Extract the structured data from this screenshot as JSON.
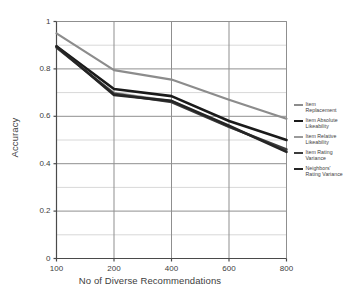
{
  "chart_data": {
    "type": "line",
    "title": "",
    "xlabel": "No of Diverse Recommendations",
    "ylabel": "Accuracy",
    "x": [
      100,
      200,
      400,
      600,
      800
    ],
    "xtick_labels": [
      "100",
      "200",
      "400",
      "600",
      "800"
    ],
    "ytick_labels": [
      "0",
      "0.2",
      "0.4",
      "0.6",
      "0.8",
      "1"
    ],
    "ytick_values": [
      0,
      0.2,
      0.4,
      0.6,
      0.8,
      1
    ],
    "ylim": [
      0,
      1
    ],
    "xscale": "categorical",
    "grid": true,
    "minor_grid": true,
    "legend_position": "right",
    "series": [
      {
        "name": "Item Replacement",
        "color": "#8c8c8c",
        "width": 2.2,
        "values": [
          0.95,
          0.795,
          0.755,
          0.67,
          0.59
        ]
      },
      {
        "name": "Item Absolute Likeability",
        "color": "#1a1a1a",
        "width": 2.6,
        "values": [
          0.895,
          0.715,
          0.685,
          0.58,
          0.5
        ]
      },
      {
        "name": "Item Relative Likeability",
        "color": "#9a9a9a",
        "width": 1.8,
        "values": [
          0.89,
          0.7,
          0.665,
          0.555,
          0.455
        ]
      },
      {
        "name": "Item Rating Variance",
        "color": "#3c3c3c",
        "width": 2.4,
        "values": [
          0.89,
          0.695,
          0.66,
          0.555,
          0.46
        ]
      },
      {
        "name": "Neighbors' Rating Variance",
        "color": "#252525",
        "width": 2.6,
        "values": [
          0.895,
          0.69,
          0.665,
          0.56,
          0.45
        ]
      }
    ]
  },
  "legend": {
    "entries": [
      {
        "label_line1": "Item",
        "label_line2": "Replacement"
      },
      {
        "label_line1": "Item Absolute",
        "label_line2": "Likeability"
      },
      {
        "label_line1": "Item Relative",
        "label_line2": "Likeability"
      },
      {
        "label_line1": "Item Rating",
        "label_line2": "Variance"
      },
      {
        "label_line1": "Neighbors'",
        "label_line2": "Rating Variance"
      }
    ]
  },
  "axes": {
    "x_title": "No of Diverse Recommendations",
    "y_title": "Accuracy"
  },
  "colors": {
    "axis": "#4a4a4a",
    "grid_major": "#8f8f8f",
    "grid_minor": "#d8d8d8",
    "background": "#ffffff",
    "text": "#3d3d3d"
  }
}
